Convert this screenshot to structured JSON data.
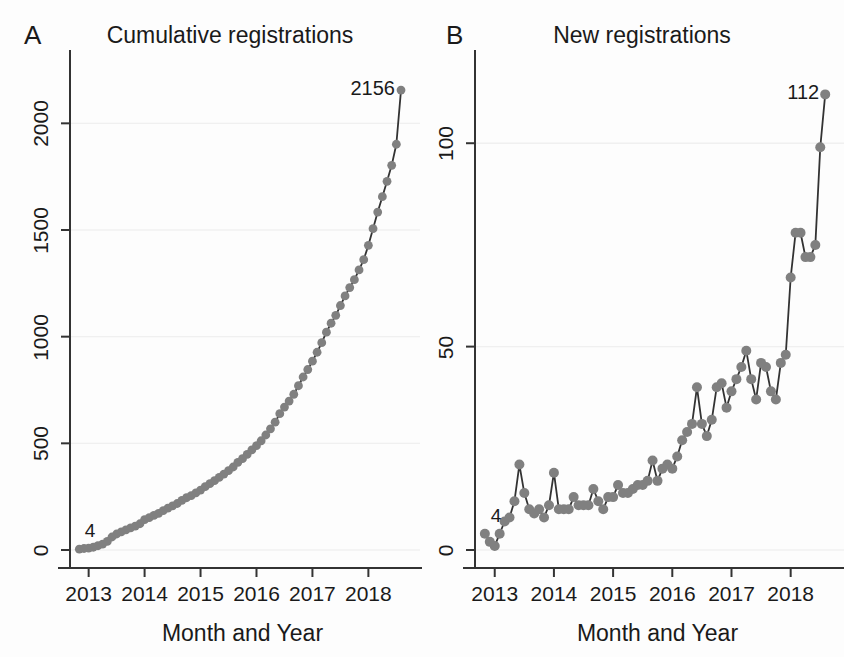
{
  "figure": {
    "background": "#fdfdfd",
    "marker_color": "#808080",
    "line_color": "#333333",
    "grid_color": "#f0f0f0",
    "axis_color": "#333333",
    "text_color": "#1a1a1a"
  },
  "panels": [
    {
      "letter": "A",
      "title": "Cumulative registrations",
      "xlabel": "Month and Year",
      "start_label": "4",
      "end_label": "2156"
    },
    {
      "letter": "B",
      "title": "New registrations",
      "xlabel": "Month and Year",
      "start_label": "4",
      "end_label": "112"
    }
  ],
  "chart_data": [
    {
      "type": "line",
      "panel": "A",
      "title": "Cumulative registrations",
      "xlabel": "Month and Year",
      "ylabel": "",
      "ylim": [
        0,
        2250
      ],
      "xlim": [
        "2012-09",
        "2018-11"
      ],
      "yticks": [
        0,
        500,
        1000,
        1500,
        2000
      ],
      "ytick_labels": [
        "0",
        "500",
        "1000",
        "1500",
        "2000"
      ],
      "xticks": [
        "2013",
        "2014",
        "2015",
        "2016",
        "2017",
        "2018"
      ],
      "xtick_labels": [
        "2013",
        "2014",
        "2015",
        "2016",
        "2017",
        "2018"
      ],
      "grid": true,
      "markers": true,
      "annotations": [
        {
          "text": "4",
          "x": "2013-01",
          "y": 4
        },
        {
          "text": "2156",
          "x": "2018-08",
          "y": 2156
        }
      ],
      "x": [
        "2012-11",
        "2012-12",
        "2013-01",
        "2013-02",
        "2013-03",
        "2013-04",
        "2013-05",
        "2013-06",
        "2013-07",
        "2013-08",
        "2013-09",
        "2013-10",
        "2013-11",
        "2013-12",
        "2014-01",
        "2014-02",
        "2014-03",
        "2014-04",
        "2014-05",
        "2014-06",
        "2014-07",
        "2014-08",
        "2014-09",
        "2014-10",
        "2014-11",
        "2014-12",
        "2015-01",
        "2015-02",
        "2015-03",
        "2015-04",
        "2015-05",
        "2015-06",
        "2015-07",
        "2015-08",
        "2015-09",
        "2015-10",
        "2015-11",
        "2015-12",
        "2016-01",
        "2016-02",
        "2016-03",
        "2016-04",
        "2016-05",
        "2016-06",
        "2016-07",
        "2016-08",
        "2016-09",
        "2016-10",
        "2016-11",
        "2016-12",
        "2017-01",
        "2017-02",
        "2017-03",
        "2017-04",
        "2017-05",
        "2017-06",
        "2017-07",
        "2017-08",
        "2017-09",
        "2017-10",
        "2017-11",
        "2017-12",
        "2018-01",
        "2018-02",
        "2018-03",
        "2018-04",
        "2018-05",
        "2018-06",
        "2018-07",
        "2018-08"
      ],
      "values": [
        4,
        7,
        9,
        13,
        20,
        28,
        40,
        61,
        75,
        85,
        94,
        104,
        112,
        123,
        142,
        152,
        162,
        172,
        185,
        196,
        207,
        218,
        233,
        245,
        255,
        268,
        281,
        297,
        311,
        325,
        340,
        356,
        372,
        389,
        411,
        428,
        448,
        469,
        489,
        512,
        539,
        568,
        599,
        639,
        670,
        698,
        730,
        770,
        811,
        846,
        885,
        927,
        972,
        1021,
        1063,
        1100,
        1146,
        1191,
        1230,
        1267,
        1313,
        1361,
        1428,
        1506,
        1584,
        1656,
        1728,
        1803,
        1902,
        2156
      ]
    },
    {
      "type": "line",
      "panel": "B",
      "title": "New registrations",
      "xlabel": "Month and Year",
      "ylabel": "",
      "ylim": [
        0,
        118
      ],
      "xlim": [
        "2012-09",
        "2018-11"
      ],
      "yticks": [
        0,
        50,
        100
      ],
      "ytick_labels": [
        "0",
        "50",
        "100"
      ],
      "xticks": [
        "2013",
        "2014",
        "2015",
        "2016",
        "2017",
        "2018"
      ],
      "xtick_labels": [
        "2013",
        "2014",
        "2015",
        "2016",
        "2017",
        "2018"
      ],
      "grid": true,
      "markers": true,
      "annotations": [
        {
          "text": "4",
          "x": "2013-01",
          "y": 4
        },
        {
          "text": "112",
          "x": "2018-08",
          "y": 112
        }
      ],
      "x": [
        "2012-11",
        "2012-12",
        "2013-01",
        "2013-02",
        "2013-03",
        "2013-04",
        "2013-05",
        "2013-06",
        "2013-07",
        "2013-08",
        "2013-09",
        "2013-10",
        "2013-11",
        "2013-12",
        "2014-01",
        "2014-02",
        "2014-03",
        "2014-04",
        "2014-05",
        "2014-06",
        "2014-07",
        "2014-08",
        "2014-09",
        "2014-10",
        "2014-11",
        "2014-12",
        "2015-01",
        "2015-02",
        "2015-03",
        "2015-04",
        "2015-05",
        "2015-06",
        "2015-07",
        "2015-08",
        "2015-09",
        "2015-10",
        "2015-11",
        "2015-12",
        "2016-01",
        "2016-02",
        "2016-03",
        "2016-04",
        "2016-05",
        "2016-06",
        "2016-07",
        "2016-08",
        "2016-09",
        "2016-10",
        "2016-11",
        "2016-12",
        "2017-01",
        "2017-02",
        "2017-03",
        "2017-04",
        "2017-05",
        "2017-06",
        "2017-07",
        "2017-08",
        "2017-09",
        "2017-10",
        "2017-11",
        "2017-12",
        "2018-01",
        "2018-02",
        "2018-03",
        "2018-04",
        "2018-05",
        "2018-06",
        "2018-07",
        "2018-08"
      ],
      "values": [
        4,
        2,
        1,
        4,
        7,
        8,
        12,
        21,
        14,
        10,
        9,
        10,
        8,
        11,
        19,
        10,
        10,
        10,
        13,
        11,
        11,
        11,
        15,
        12,
        10,
        13,
        13,
        16,
        14,
        14,
        15,
        16,
        16,
        17,
        22,
        17,
        20,
        21,
        20,
        23,
        27,
        29,
        31,
        40,
        31,
        28,
        32,
        40,
        41,
        35,
        39,
        42,
        45,
        49,
        42,
        37,
        46,
        45,
        39,
        37,
        46,
        48,
        67,
        78,
        78,
        72,
        72,
        75,
        99,
        112
      ]
    }
  ]
}
